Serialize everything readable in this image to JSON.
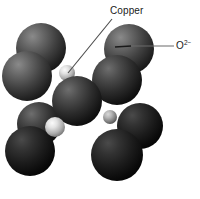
{
  "figure": {
    "background_color": "#ffffff"
  },
  "labels": {
    "copper": {
      "text": "Copper",
      "leader_line": {
        "x1": 112,
        "y1": 19,
        "x2": 68,
        "y2": 73
      }
    },
    "oxide": {
      "base": "O",
      "charge": "2−",
      "full_text": "O2−",
      "leader_line": {
        "x1": 174,
        "y1": 46,
        "x2": 131,
        "y2": 46
      },
      "tick_line": {
        "x1": 131,
        "y1": 46,
        "x2": 116,
        "y2": 47
      }
    }
  },
  "colors": {
    "oxide_sphere_light": "#5f5f5f",
    "oxide_sphere_mid": "#3c3c3c",
    "oxide_sphere_dark": "#1d1d1d",
    "oxide_sphere_darkest": "#101010",
    "copper_sphere_light": "#f2f2f2",
    "copper_sphere_mid": "#b8b8b8",
    "copper_sphere_dark": "#6a6a6a",
    "leader_line": "#4a4a4a",
    "label_text": "#1a1a1a"
  },
  "atoms": {
    "oxide_label": "O2−",
    "copper_label": "Copper",
    "oxide_spheres": [
      {
        "id": "o-top-left-back",
        "cx": 41,
        "cy": 48,
        "r": 25,
        "shade": "mid"
      },
      {
        "id": "o-left-upper",
        "cx": 27,
        "cy": 76,
        "r": 25,
        "shade": "mid"
      },
      {
        "id": "o-top-right-back",
        "cx": 129,
        "cy": 49,
        "r": 25,
        "shade": "mid"
      },
      {
        "id": "o-right-upper",
        "cx": 117,
        "cy": 80,
        "r": 25,
        "shade": "dark"
      },
      {
        "id": "o-center",
        "cx": 77,
        "cy": 101,
        "r": 25,
        "shade": "dark"
      },
      {
        "id": "o-left-lower-back",
        "cx": 39,
        "cy": 124,
        "r": 22,
        "shade": "dark"
      },
      {
        "id": "o-left-lower",
        "cx": 30,
        "cy": 151,
        "r": 25,
        "shade": "darkest"
      },
      {
        "id": "o-right-lower-back",
        "cx": 140,
        "cy": 126,
        "r": 23,
        "shade": "darkest"
      },
      {
        "id": "o-right-lower",
        "cx": 117,
        "cy": 155,
        "r": 26,
        "shade": "darkest"
      }
    ],
    "copper_spheres": [
      {
        "id": "cu-upper",
        "cx": 67,
        "cy": 73,
        "r": 8,
        "shade": "light"
      },
      {
        "id": "cu-lower",
        "cx": 55,
        "cy": 127,
        "r": 10,
        "shade": "light"
      },
      {
        "id": "cu-right",
        "cx": 93,
        "cy": 92,
        "r": 6,
        "shade": "mid"
      },
      {
        "id": "cu-center",
        "cx": 110,
        "cy": 117,
        "r": 7,
        "shade": "mid"
      }
    ]
  }
}
